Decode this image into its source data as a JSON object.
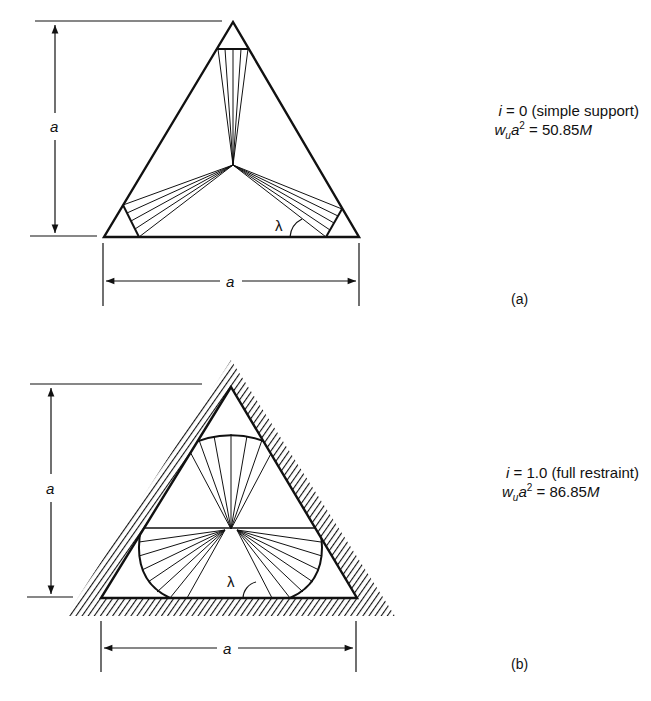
{
  "figure_a": {
    "caption": "(a)",
    "dimension_vertical": "a",
    "dimension_horizontal": "a",
    "angle_label": "λ",
    "condition_var": "i",
    "condition_value": "= 0 (simple support)",
    "eq_lhs_w": "w",
    "eq_lhs_sub": "u",
    "eq_lhs_a": "a",
    "eq_lhs_sup": "2",
    "eq_rhs": "= 50.85",
    "eq_unit": "M"
  },
  "figure_b": {
    "caption": "(b)",
    "dimension_vertical": "a",
    "dimension_horizontal": "a",
    "angle_label": "λ",
    "condition_var": "i",
    "condition_value": "= 1.0 (full restraint)",
    "eq_lhs_w": "w",
    "eq_lhs_sub": "u",
    "eq_lhs_a": "a",
    "eq_lhs_sup": "2",
    "eq_rhs": "= 86.85",
    "eq_unit": "M"
  }
}
